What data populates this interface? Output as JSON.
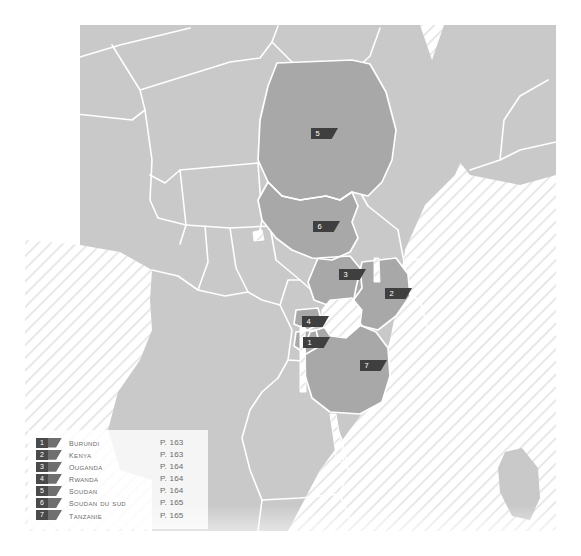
{
  "map": {
    "title": "Afrique de l'Est",
    "colors": {
      "land": "#c9c9c9",
      "land_highlight": "#a8a8a8",
      "border": "#ffffff",
      "water_hatch": "#e2e2e2",
      "marker_dark": "#3f3f3f",
      "marker_tail": "#6f6f6f",
      "legend_text": "#6b6b6b",
      "background": "#ffffff"
    },
    "markers": [
      {
        "number": "1",
        "country": "Burundi",
        "x": 303,
        "y": 337
      },
      {
        "number": "2",
        "country": "Kenya",
        "x": 385,
        "y": 288
      },
      {
        "number": "3",
        "country": "Ouganda",
        "x": 339,
        "y": 269
      },
      {
        "number": "4",
        "country": "Rwanda",
        "x": 302,
        "y": 316
      },
      {
        "number": "5",
        "country": "Soudan",
        "x": 311,
        "y": 128
      },
      {
        "number": "6",
        "country": "Soudan du Sud",
        "x": 313,
        "y": 221
      },
      {
        "number": "7",
        "country": "Tanzanie",
        "x": 360,
        "y": 360
      }
    ]
  },
  "legend": {
    "items": [
      {
        "number": "1",
        "name": "Burundi",
        "page": "P. 163"
      },
      {
        "number": "2",
        "name": "Kenya",
        "page": "P. 163"
      },
      {
        "number": "3",
        "name": "Ouganda",
        "page": "P. 164"
      },
      {
        "number": "4",
        "name": "Rwanda",
        "page": "P. 164"
      },
      {
        "number": "5",
        "name": "Soudan",
        "page": "P. 164"
      },
      {
        "number": "6",
        "name": "Soudan du Sud",
        "page": "P. 165"
      },
      {
        "number": "7",
        "name": "Tanzanie",
        "page": "P. 165"
      }
    ]
  }
}
